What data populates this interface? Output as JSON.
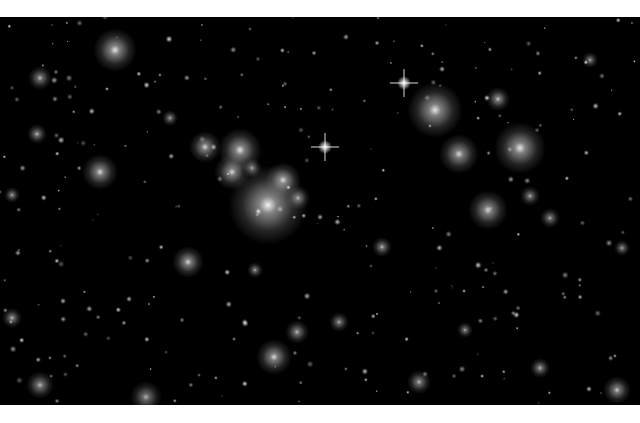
{
  "image": {
    "subject": "galaxy cluster deep field",
    "background_color": "#000000",
    "frame_color": "#ffffff"
  },
  "galaxies": [
    {
      "x": 268,
      "y": 205,
      "r": 40,
      "a": 0.95
    },
    {
      "x": 240,
      "y": 150,
      "r": 22,
      "a": 0.9
    },
    {
      "x": 205,
      "y": 147,
      "r": 16,
      "a": 0.85
    },
    {
      "x": 232,
      "y": 172,
      "r": 18,
      "a": 0.85
    },
    {
      "x": 283,
      "y": 180,
      "r": 18,
      "a": 0.85
    },
    {
      "x": 298,
      "y": 198,
      "r": 12,
      "a": 0.7
    },
    {
      "x": 252,
      "y": 168,
      "r": 10,
      "a": 0.7
    },
    {
      "x": 435,
      "y": 110,
      "r": 28,
      "a": 0.9
    },
    {
      "x": 459,
      "y": 154,
      "r": 20,
      "a": 0.85
    },
    {
      "x": 520,
      "y": 148,
      "r": 26,
      "a": 0.9
    },
    {
      "x": 488,
      "y": 210,
      "r": 20,
      "a": 0.85
    },
    {
      "x": 498,
      "y": 99,
      "r": 12,
      "a": 0.8
    },
    {
      "x": 530,
      "y": 196,
      "r": 10,
      "a": 0.7
    },
    {
      "x": 550,
      "y": 218,
      "r": 10,
      "a": 0.7
    },
    {
      "x": 115,
      "y": 50,
      "r": 22,
      "a": 0.9
    },
    {
      "x": 100,
      "y": 172,
      "r": 18,
      "a": 0.85
    },
    {
      "x": 188,
      "y": 262,
      "r": 16,
      "a": 0.85
    },
    {
      "x": 274,
      "y": 357,
      "r": 18,
      "a": 0.85
    },
    {
      "x": 297,
      "y": 332,
      "r": 12,
      "a": 0.75
    },
    {
      "x": 339,
      "y": 322,
      "r": 10,
      "a": 0.7
    },
    {
      "x": 40,
      "y": 78,
      "r": 12,
      "a": 0.75
    },
    {
      "x": 37,
      "y": 134,
      "r": 10,
      "a": 0.75
    },
    {
      "x": 12,
      "y": 195,
      "r": 8,
      "a": 0.7
    },
    {
      "x": 12,
      "y": 318,
      "r": 10,
      "a": 0.75
    },
    {
      "x": 382,
      "y": 247,
      "r": 10,
      "a": 0.75
    },
    {
      "x": 419,
      "y": 382,
      "r": 12,
      "a": 0.75
    },
    {
      "x": 540,
      "y": 368,
      "r": 10,
      "a": 0.75
    },
    {
      "x": 617,
      "y": 390,
      "r": 14,
      "a": 0.8
    },
    {
      "x": 590,
      "y": 60,
      "r": 8,
      "a": 0.7
    },
    {
      "x": 146,
      "y": 397,
      "r": 16,
      "a": 0.7
    },
    {
      "x": 40,
      "y": 385,
      "r": 14,
      "a": 0.75
    },
    {
      "x": 465,
      "y": 330,
      "r": 8,
      "a": 0.7
    },
    {
      "x": 622,
      "y": 248,
      "r": 8,
      "a": 0.7
    },
    {
      "x": 255,
      "y": 270,
      "r": 8,
      "a": 0.7
    },
    {
      "x": 170,
      "y": 118,
      "r": 8,
      "a": 0.7
    }
  ],
  "stars": [
    {
      "x": 404,
      "y": 83
    },
    {
      "x": 325,
      "y": 147
    }
  ]
}
